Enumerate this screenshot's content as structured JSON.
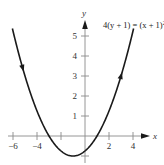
{
  "chart_data": {
    "type": "line",
    "title": "",
    "equation_label": "4(y + 1) = (x + 1)²",
    "equation_main": "4(y + 1) = (x + 1)",
    "equation_exponent": "2",
    "xlabel": "x",
    "ylabel": "y",
    "xlim": [
      -6.5,
      5.5
    ],
    "ylim": [
      -1.5,
      6
    ],
    "x_ticks": [
      -6,
      -4,
      -2,
      0,
      2,
      4
    ],
    "x_tick_labels": [
      "−6",
      "−4",
      "",
      "",
      "2",
      "4"
    ],
    "y_ticks": [
      -1,
      1,
      2,
      3,
      4,
      5
    ],
    "y_tick_labels": [
      "",
      "1",
      "2",
      "3",
      "4",
      "5"
    ],
    "grid": false,
    "legend": null,
    "series": [
      {
        "name": "4(y + 1) = (x + 1)^2",
        "x": [
          -6,
          -5,
          -4,
          -3,
          -2,
          -1,
          0,
          1,
          2,
          3,
          4
        ],
        "y": [
          5.25,
          3,
          1.25,
          0,
          -0.75,
          -1,
          -0.75,
          0,
          1.25,
          3,
          5.25
        ],
        "vertex": [
          -1,
          -1
        ],
        "orientation_arrows": [
          {
            "at_x": -5.2,
            "direction": "down"
          },
          {
            "at_x": 3,
            "direction": "up"
          }
        ],
        "color": "#1a1a1a"
      }
    ]
  }
}
